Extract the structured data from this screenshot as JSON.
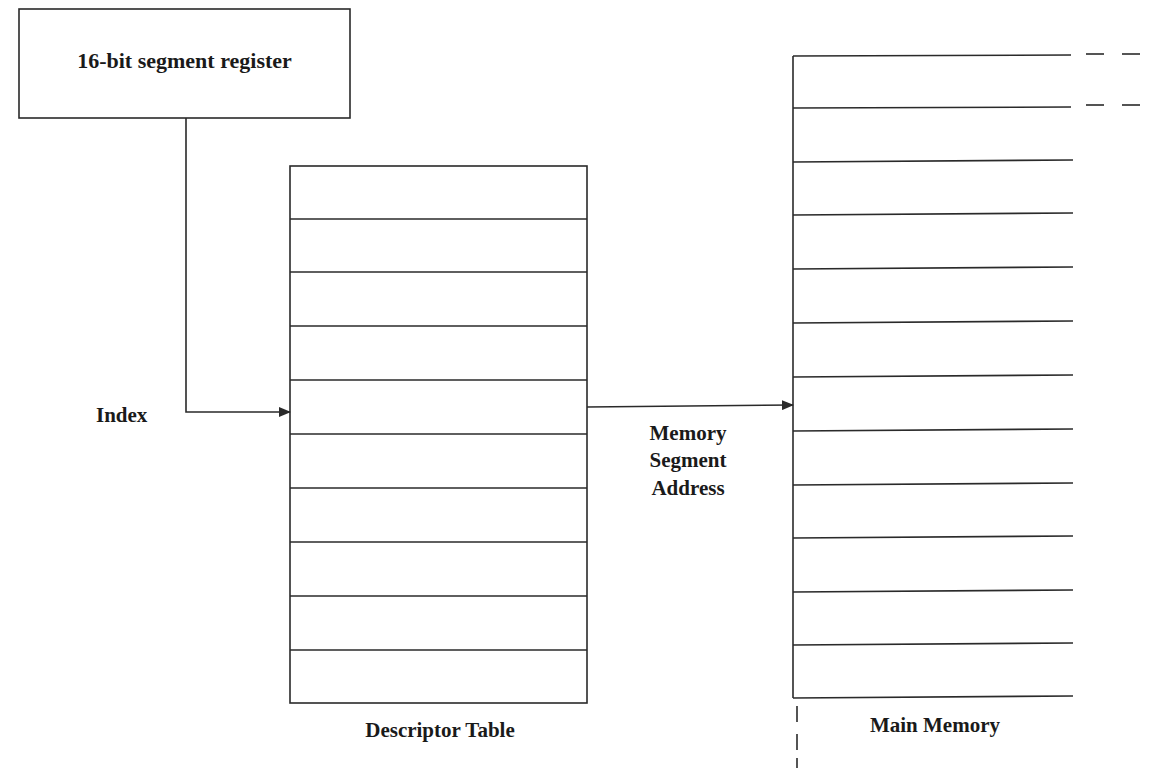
{
  "diagram": {
    "register_box": {
      "label": "16-bit segment register"
    },
    "index_label": "Index",
    "descriptor_table": {
      "label": "Descriptor Table",
      "row_count": 10
    },
    "arrow_label": {
      "line1": "Memory",
      "line2": "Segment",
      "line3": "Address"
    },
    "main_memory": {
      "label": "Main Memory",
      "row_count": 12
    },
    "colors": {
      "stroke": "#2a2a2a",
      "background": "#ffffff",
      "text": "#1a1a1a"
    }
  }
}
